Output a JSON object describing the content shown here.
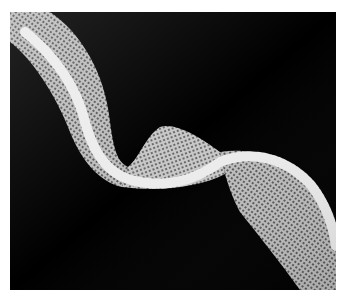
{
  "image": {
    "subject": "white knitted mesh ribbon twisting on a black background",
    "background_color": "#000000",
    "border_color": "#ffffff",
    "ribbon_color": "#d8d8d8",
    "edge_color": "#f2f2f2"
  }
}
